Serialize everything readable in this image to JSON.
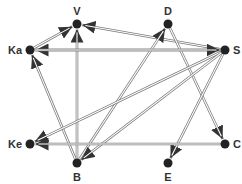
{
  "diagram": {
    "type": "directed-graph",
    "edge_style": "double-line",
    "colors": {
      "node": "#222222",
      "edge": "#7a7a7a",
      "label": "#333333",
      "background": "#ffffff"
    },
    "nodes": [
      {
        "id": "V",
        "label": "V",
        "x": 77,
        "y": 24,
        "label_pos": "top"
      },
      {
        "id": "D",
        "label": "D",
        "x": 168,
        "y": 24,
        "label_pos": "top"
      },
      {
        "id": "Ka",
        "label": "Ka",
        "x": 30,
        "y": 50,
        "label_pos": "left"
      },
      {
        "id": "S",
        "label": "S",
        "x": 225,
        "y": 50,
        "label_pos": "right"
      },
      {
        "id": "Ke",
        "label": "Ke",
        "x": 30,
        "y": 144,
        "label_pos": "left"
      },
      {
        "id": "C",
        "label": "C",
        "x": 225,
        "y": 144,
        "label_pos": "right"
      },
      {
        "id": "B",
        "label": "B",
        "x": 77,
        "y": 163,
        "label_pos": "bottom"
      },
      {
        "id": "E",
        "label": "E",
        "x": 168,
        "y": 163,
        "label_pos": "bottom"
      }
    ],
    "edges": [
      {
        "from": "Ka",
        "to": "V"
      },
      {
        "from": "S",
        "to": "V"
      },
      {
        "from": "B",
        "to": "V"
      },
      {
        "from": "S",
        "to": "Ka"
      },
      {
        "from": "B",
        "to": "Ka"
      },
      {
        "from": "B",
        "to": "D"
      },
      {
        "from": "D",
        "to": "C"
      },
      {
        "from": "S",
        "to": "Ke"
      },
      {
        "from": "S",
        "to": "B"
      },
      {
        "from": "S",
        "to": "E"
      },
      {
        "from": "C",
        "to": "Ke"
      },
      {
        "from": "Ka",
        "to": "S"
      }
    ]
  }
}
